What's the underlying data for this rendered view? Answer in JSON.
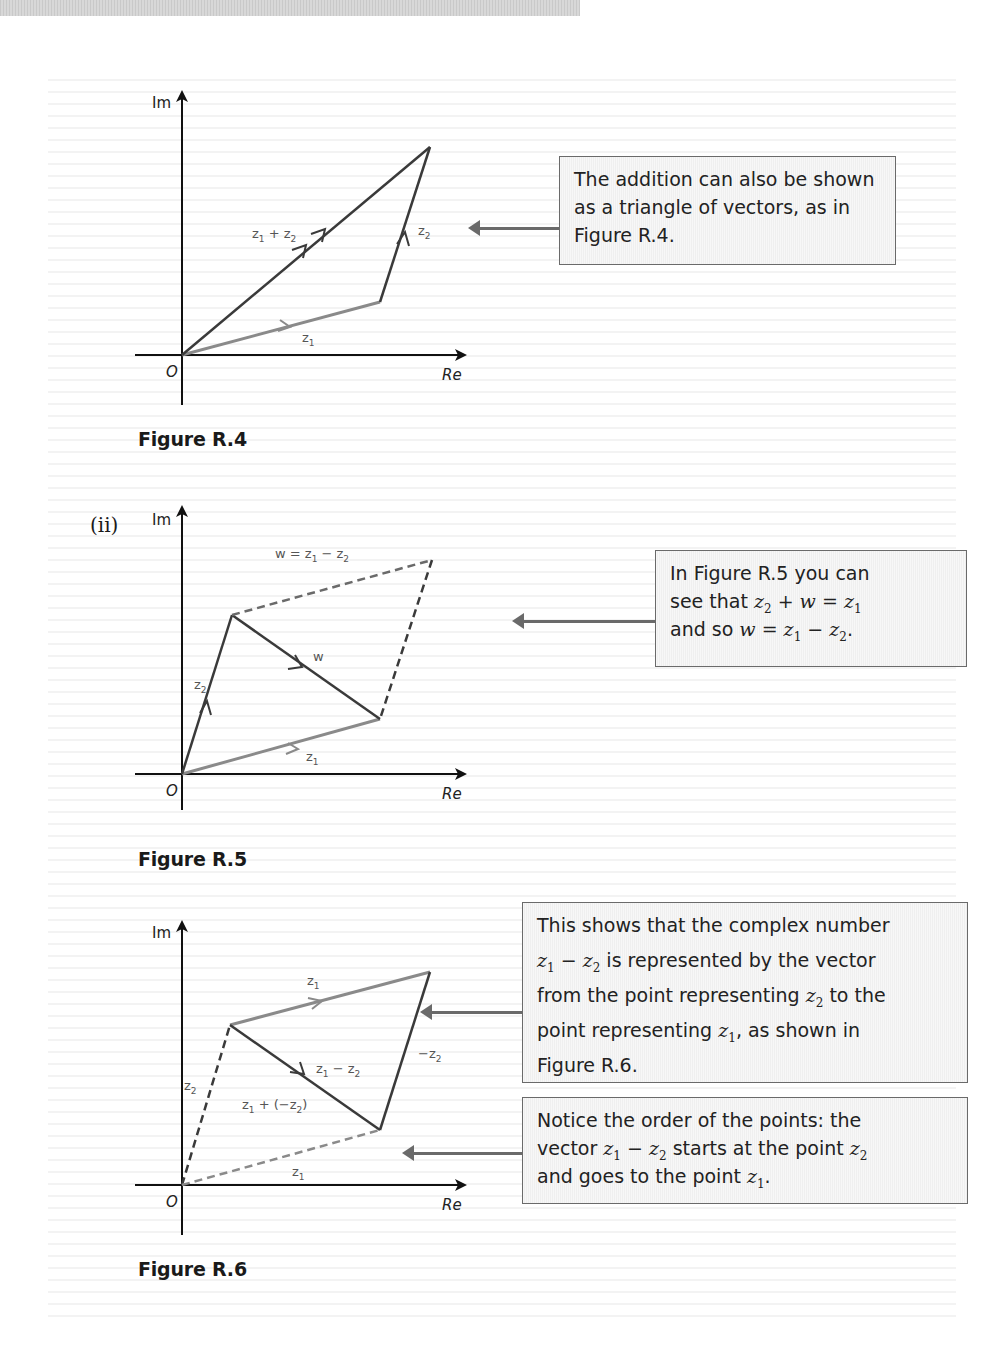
{
  "figures": [
    {
      "id": "R.4",
      "caption": "Figure R.4",
      "axes": {
        "y_label": "Im",
        "x_label": "Re",
        "origin": "O"
      },
      "vectors": [
        {
          "label": "z1",
          "text": "z",
          "sub": "1",
          "style": "solid",
          "color": "#8a8a8a"
        },
        {
          "label": "z2",
          "text": "z",
          "sub": "2",
          "style": "solid",
          "color": "#3a3a3a"
        },
        {
          "label": "z1 + z2",
          "text_a": "z",
          "sub_a": "1",
          "op": " + ",
          "text_b": "z",
          "sub_b": "2",
          "style": "solid",
          "color": "#3a3a3a"
        }
      ]
    },
    {
      "id": "R.5",
      "part": "(ii)",
      "caption": "Figure R.5",
      "axes": {
        "y_label": "Im",
        "x_label": "Re",
        "origin": "O"
      },
      "vectors": [
        {
          "label": "z1",
          "text": "z",
          "sub": "1",
          "style": "solid",
          "color": "#8a8a8a"
        },
        {
          "label": "z2",
          "text": "z",
          "sub": "2",
          "style": "solid",
          "color": "#3a3a3a"
        },
        {
          "label": "w",
          "text": "w",
          "style": "solid",
          "color": "#3a3a3a"
        },
        {
          "label": "w = z1 − z2",
          "text": "w = z",
          "sub_a": "1",
          "op": " − z",
          "sub_b": "2",
          "style": "dashed",
          "color": "#8a8a8a"
        }
      ]
    },
    {
      "id": "R.6",
      "caption": "Figure R.6",
      "axes": {
        "y_label": "Im",
        "x_label": "Re",
        "origin": "O"
      },
      "vectors": [
        {
          "label": "z1 (top)",
          "text": "z",
          "sub": "1",
          "style": "solid",
          "color": "#8a8a8a"
        },
        {
          "label": "z1 − z2",
          "text": "z",
          "sub_a": "1",
          "op": " − z",
          "sub_b": "2",
          "style": "solid",
          "color": "#3a3a3a"
        },
        {
          "label": "−z2",
          "text": "−z",
          "sub": "2",
          "style": "solid",
          "color": "#3a3a3a"
        },
        {
          "label": "z2 (dashed)",
          "text": "z",
          "sub": "2",
          "style": "dashed",
          "color": "#3a3a3a"
        },
        {
          "label": "z1 (dashed)",
          "text": "z",
          "sub": "1",
          "style": "dashed",
          "color": "#8a8a8a"
        },
        {
          "label": "z1 + (−z2)",
          "text": "z",
          "sub_a": "1",
          "op": " + (−z",
          "sub_b": "2",
          "close": ")",
          "style": "text",
          "color": "#3a3a3a"
        }
      ]
    }
  ],
  "callouts": [
    {
      "id": "callout-1",
      "text": "The addition can also be shown as a triangle of vectors, as in Figure R.4."
    },
    {
      "id": "callout-2",
      "line1": "In Figure R.5 you can",
      "line2_pre": "see that ",
      "line3_pre": "and so "
    },
    {
      "id": "callout-3",
      "line1": "This shows that the complex number",
      "line2_post": " is represented by the vector",
      "line3_pre": "from the point representing ",
      "line3_post": " to the",
      "line4_pre": "point representing ",
      "line4_post": ", as shown in",
      "line5": "Figure R.6."
    },
    {
      "id": "callout-4",
      "line1": "Notice the order of the points: the",
      "line2_pre": "vector ",
      "line2_mid": " starts at the point ",
      "line3_pre": "and goes to the point ",
      "line3_post": "."
    }
  ],
  "colors": {
    "light_vector": "#8a8a8a",
    "dark_vector": "#3a3a3a",
    "border": "#6a6a6a"
  }
}
